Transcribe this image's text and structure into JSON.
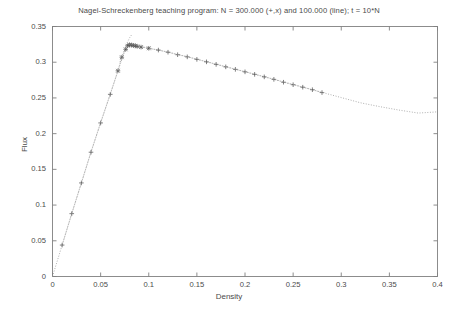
{
  "chart_data": {
    "type": "scatter",
    "title": "Nagel-Schreckenberg teaching program: N = 300.000 (+,x) and 100.000 (line); t = 10*N",
    "xlabel": "Density",
    "ylabel": "Flux",
    "xlim": [
      0,
      0.4
    ],
    "ylim": [
      0,
      0.35
    ],
    "xticks": [
      "0",
      "0.05",
      "0.1",
      "0.15",
      "0.2",
      "0.25",
      "0.3",
      "0.35",
      "0.4"
    ],
    "xtick_values": [
      0,
      0.05,
      0.1,
      0.15,
      0.2,
      0.25,
      0.3,
      0.35,
      0.4
    ],
    "yticks": [
      "0",
      "0.05",
      "0.1",
      "0.15",
      "0.2",
      "0.25",
      "0.3",
      "0.35"
    ],
    "ytick_values": [
      0,
      0.05,
      0.1,
      0.15,
      0.2,
      0.25,
      0.3,
      0.35
    ],
    "grid": false,
    "legend": "none",
    "series": [
      {
        "name": "N = 300.000 markers",
        "marker": "plus",
        "points": [
          [
            0.01,
            0.044
          ],
          [
            0.02,
            0.088
          ],
          [
            0.03,
            0.131
          ],
          [
            0.04,
            0.174
          ],
          [
            0.05,
            0.215
          ],
          [
            0.06,
            0.255
          ],
          [
            0.068,
            0.288
          ],
          [
            0.072,
            0.307
          ],
          [
            0.076,
            0.318
          ],
          [
            0.078,
            0.323
          ],
          [
            0.08,
            0.3245
          ],
          [
            0.082,
            0.324
          ],
          [
            0.084,
            0.3235
          ],
          [
            0.086,
            0.323
          ],
          [
            0.088,
            0.3222
          ],
          [
            0.092,
            0.3212
          ],
          [
            0.1,
            0.3195
          ],
          [
            0.11,
            0.317
          ],
          [
            0.12,
            0.314
          ],
          [
            0.13,
            0.3105
          ],
          [
            0.14,
            0.3075
          ],
          [
            0.15,
            0.304
          ],
          [
            0.16,
            0.3005
          ],
          [
            0.17,
            0.297
          ],
          [
            0.18,
            0.2935
          ],
          [
            0.19,
            0.29
          ],
          [
            0.2,
            0.2865
          ],
          [
            0.21,
            0.283
          ],
          [
            0.22,
            0.2795
          ],
          [
            0.23,
            0.276
          ],
          [
            0.24,
            0.272
          ],
          [
            0.25,
            0.2685
          ],
          [
            0.26,
            0.265
          ],
          [
            0.27,
            0.2615
          ],
          [
            0.28,
            0.2575
          ]
        ]
      },
      {
        "name": "N = 100.000 line",
        "marker": "none",
        "points": [
          [
            0.0,
            0.0
          ],
          [
            0.01,
            0.044
          ],
          [
            0.02,
            0.088
          ],
          [
            0.03,
            0.131
          ],
          [
            0.04,
            0.1745
          ],
          [
            0.05,
            0.2155
          ],
          [
            0.06,
            0.2555
          ],
          [
            0.07,
            0.296
          ],
          [
            0.076,
            0.319
          ],
          [
            0.08,
            0.325
          ],
          [
            0.084,
            0.3243
          ],
          [
            0.09,
            0.3225
          ],
          [
            0.1,
            0.3196
          ],
          [
            0.12,
            0.3142
          ],
          [
            0.14,
            0.3078
          ],
          [
            0.16,
            0.3008
          ],
          [
            0.18,
            0.2938
          ],
          [
            0.2,
            0.2868
          ],
          [
            0.22,
            0.2798
          ],
          [
            0.24,
            0.2725
          ],
          [
            0.26,
            0.2652
          ],
          [
            0.28,
            0.2578
          ],
          [
            0.3,
            0.2505
          ],
          [
            0.32,
            0.2432
          ],
          [
            0.34,
            0.2378
          ],
          [
            0.36,
            0.233
          ],
          [
            0.38,
            0.2288
          ],
          [
            0.4,
            0.2305
          ]
        ]
      },
      {
        "name": "N = 300.000 peak extension",
        "marker": "none",
        "points": [
          [
            0.07,
            0.3
          ],
          [
            0.076,
            0.3225
          ],
          [
            0.08,
            0.334
          ],
          [
            0.082,
            0.338
          ]
        ]
      }
    ],
    "colors": {
      "axis": "#808080",
      "data_line": "#9a9a9a",
      "marker": "#555555",
      "background": "#ffffff",
      "text": "#4a4a4a"
    }
  }
}
